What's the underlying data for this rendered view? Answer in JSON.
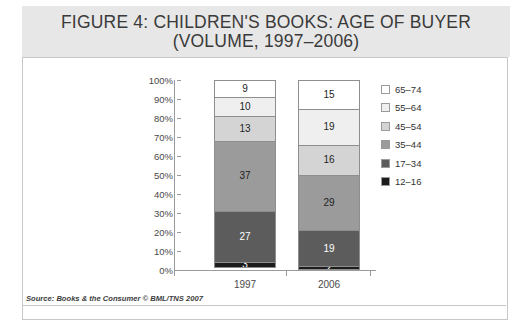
{
  "figure": {
    "title_line1": "FIGURE 4: CHILDREN'S BOOKS: AGE OF BUYER",
    "title_line2": "(VOLUME, 1997–2006)",
    "source": "Source: Books & the Consumer © BML/TNS 2007"
  },
  "chart_data": {
    "type": "bar",
    "stacked": true,
    "stack_mode": "percent",
    "title": "FIGURE 4: CHILDREN'S BOOKS: AGE OF BUYER (VOLUME, 1997–2006)",
    "xlabel": "",
    "ylabel": "",
    "ylim": [
      0,
      100
    ],
    "grid": false,
    "legend_position": "right",
    "categories": [
      "1997",
      "2006"
    ],
    "ytick_labels": [
      "100%",
      "90%",
      "80%",
      "70%",
      "60%",
      "50%",
      "40%",
      "30%",
      "20%",
      "10%",
      "0%"
    ],
    "ytick_values": [
      100,
      90,
      80,
      70,
      60,
      50,
      40,
      30,
      20,
      10,
      0
    ],
    "series": [
      {
        "name": "12–16",
        "color": "#1c1c1c",
        "values": [
          3,
          2
        ]
      },
      {
        "name": "17–34",
        "color": "#5c5c5c",
        "values": [
          27,
          19
        ]
      },
      {
        "name": "35–44",
        "color": "#9b9b9b",
        "values": [
          37,
          29
        ]
      },
      {
        "name": "45–54",
        "color": "#d4d4d4",
        "values": [
          13,
          16
        ]
      },
      {
        "name": "55–64",
        "color": "#efefef",
        "values": [
          10,
          19
        ]
      },
      {
        "name": "65–74",
        "color": "#ffffff",
        "values": [
          9,
          15
        ]
      }
    ],
    "legend_order_top_to_bottom": [
      "65–74",
      "55–64",
      "45–54",
      "35–44",
      "17–34",
      "12–16"
    ]
  },
  "legend": [
    {
      "label": "65–74",
      "color": "#ffffff"
    },
    {
      "label": "55–64",
      "color": "#efefef"
    },
    {
      "label": "45–54",
      "color": "#d4d4d4"
    },
    {
      "label": "35–44",
      "color": "#9b9b9b"
    },
    {
      "label": "17–34",
      "color": "#5c5c5c"
    },
    {
      "label": "12–16",
      "color": "#1c1c1c"
    }
  ],
  "bars": [
    {
      "category": "1997",
      "segments": [
        {
          "series": "65–74",
          "value": 9,
          "label": "9",
          "color": "#ffffff",
          "dark": false
        },
        {
          "series": "55–64",
          "value": 10,
          "label": "10",
          "color": "#efefef",
          "dark": false
        },
        {
          "series": "45–54",
          "value": 13,
          "label": "13",
          "color": "#d4d4d4",
          "dark": false
        },
        {
          "series": "35–44",
          "value": 37,
          "label": "37",
          "color": "#9b9b9b",
          "dark": false
        },
        {
          "series": "17–34",
          "value": 27,
          "label": "27",
          "color": "#5c5c5c",
          "dark": true
        },
        {
          "series": "12–16",
          "value": 3,
          "label": "3",
          "color": "#1c1c1c",
          "dark": true
        }
      ]
    },
    {
      "category": "2006",
      "segments": [
        {
          "series": "65–74",
          "value": 15,
          "label": "15",
          "color": "#ffffff",
          "dark": false
        },
        {
          "series": "55–64",
          "value": 19,
          "label": "19",
          "color": "#efefef",
          "dark": false
        },
        {
          "series": "45–54",
          "value": 16,
          "label": "16",
          "color": "#d4d4d4",
          "dark": false
        },
        {
          "series": "35–44",
          "value": 29,
          "label": "29",
          "color": "#9b9b9b",
          "dark": false
        },
        {
          "series": "17–34",
          "value": 19,
          "label": "19",
          "color": "#5c5c5c",
          "dark": true
        },
        {
          "series": "12–16",
          "value": 2,
          "label": "2",
          "color": "#1c1c1c",
          "dark": true
        }
      ]
    }
  ]
}
